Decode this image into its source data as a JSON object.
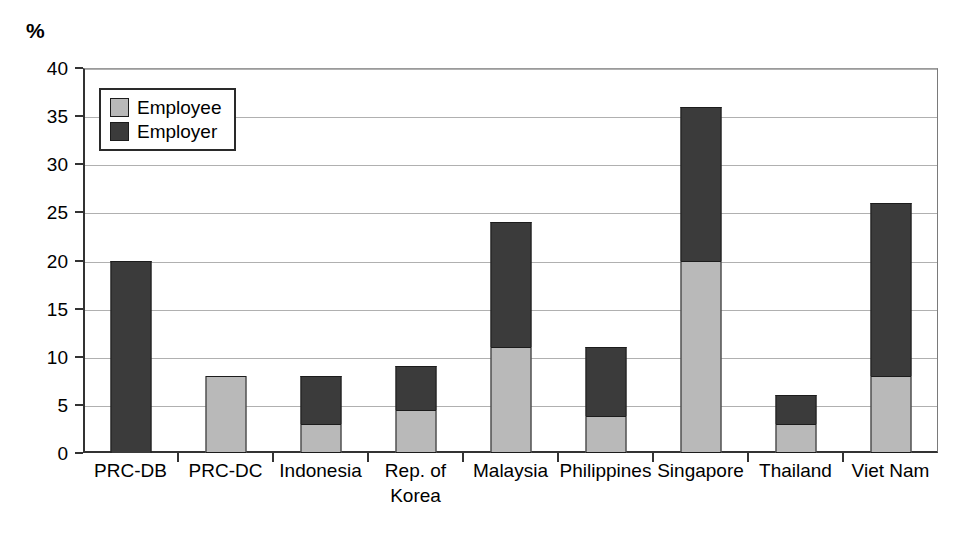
{
  "chart_data": {
    "type": "bar",
    "subtype": "stacked-bar",
    "title": "",
    "xlabel": "",
    "ylabel": "%",
    "ylim": [
      0,
      40
    ],
    "yticks": [
      0,
      5,
      10,
      15,
      20,
      25,
      30,
      35,
      40
    ],
    "grid": true,
    "legend_position": "top-left-inside",
    "categories": [
      "PRC-DB",
      "PRC-DC",
      "Indonesia",
      "Rep. of\nKorea",
      "Malaysia",
      "Philippines",
      "Singapore",
      "Thailand",
      "Viet Nam"
    ],
    "series": [
      {
        "name": "Employee",
        "color": "#b9b9b9",
        "values": [
          0,
          8,
          3,
          4.5,
          11,
          3.8,
          20,
          3,
          8
        ]
      },
      {
        "name": "Employer",
        "color": "#3b3b3b",
        "values": [
          20,
          0,
          5,
          4.5,
          13,
          7.2,
          16,
          3,
          18
        ]
      }
    ],
    "totals": [
      20,
      8,
      8,
      9,
      24,
      11,
      36,
      6,
      26
    ]
  },
  "axis": {
    "unit_label": "%",
    "y_tick_labels": [
      "0",
      "5",
      "10",
      "15",
      "20",
      "25",
      "30",
      "35",
      "40"
    ]
  },
  "legend": {
    "items": [
      {
        "label": "Employee",
        "swatch": "employee"
      },
      {
        "label": "Employer",
        "swatch": "employer"
      }
    ]
  },
  "colors": {
    "employee": "#b9b9b9",
    "employer": "#3b3b3b",
    "axis": "#333333",
    "grid": "#b0b0b0",
    "background": "#ffffff"
  }
}
